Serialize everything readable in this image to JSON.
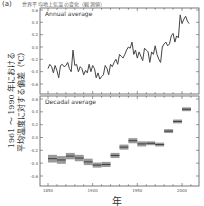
{
  "figure": {
    "panel_label": "(a)",
    "title_text": "世界平均地上気温の変化（観測値）",
    "ylabel_line1": "1961 ～ 1990 年における",
    "ylabel_line2": "平均温度に対する偏差（℃）",
    "xlabel": "年"
  },
  "chart_data": [
    {
      "type": "line",
      "title": "Annual average",
      "xlabel": "年",
      "ylabel": "1961～1990年における平均温度に対する偏差（℃）",
      "xlim": [
        1845,
        2015
      ],
      "ylim": [
        -0.65,
        0.62
      ],
      "yticks": [
        -0.6,
        -0.4,
        -0.2,
        0.0,
        0.2,
        0.4,
        0.6
      ],
      "ytick_labels": [
        "-0.6",
        "-0.4",
        "-0.2",
        "0.0",
        "0.2",
        "0.4",
        "0.6"
      ],
      "grid": false,
      "x": [
        1850,
        1852,
        1854,
        1856,
        1858,
        1860,
        1862,
        1864,
        1866,
        1868,
        1870,
        1872,
        1874,
        1876,
        1878,
        1880,
        1882,
        1884,
        1886,
        1888,
        1890,
        1892,
        1894,
        1896,
        1898,
        1900,
        1902,
        1904,
        1906,
        1908,
        1910,
        1912,
        1914,
        1916,
        1918,
        1920,
        1922,
        1924,
        1926,
        1928,
        1930,
        1932,
        1934,
        1936,
        1938,
        1940,
        1942,
        1944,
        1946,
        1948,
        1950,
        1952,
        1954,
        1956,
        1958,
        1960,
        1962,
        1964,
        1966,
        1968,
        1970,
        1972,
        1974,
        1976,
        1978,
        1980,
        1982,
        1984,
        1986,
        1988,
        1990,
        1992,
        1994,
        1996,
        1998,
        2000,
        2002,
        2004,
        2006,
        2008
      ],
      "values": [
        -0.35,
        -0.28,
        -0.32,
        -0.42,
        -0.3,
        -0.38,
        -0.5,
        -0.3,
        -0.28,
        -0.32,
        -0.3,
        -0.25,
        -0.35,
        -0.4,
        -0.05,
        -0.3,
        -0.28,
        -0.4,
        -0.32,
        -0.35,
        -0.45,
        -0.38,
        -0.42,
        -0.28,
        -0.4,
        -0.3,
        -0.35,
        -0.5,
        -0.42,
        -0.52,
        -0.48,
        -0.45,
        -0.3,
        -0.35,
        -0.45,
        -0.28,
        -0.32,
        -0.25,
        -0.2,
        -0.28,
        -0.12,
        -0.15,
        -0.18,
        -0.12,
        -0.05,
        0.0,
        -0.02,
        0.08,
        -0.12,
        -0.05,
        -0.18,
        -0.08,
        -0.15,
        -0.22,
        -0.02,
        -0.05,
        -0.08,
        -0.25,
        -0.08,
        -0.12,
        0.02,
        -0.12,
        -0.2,
        -0.25,
        0.0,
        0.05,
        0.08,
        0.02,
        0.05,
        0.18,
        0.22,
        0.08,
        0.18,
        0.15,
        0.52,
        0.38,
        0.45,
        0.5,
        0.42,
        0.38
      ],
      "series_name": "Annual average"
    },
    {
      "type": "bar",
      "title": "Decadal average",
      "xlabel": "年",
      "xlim": [
        1845,
        2015
      ],
      "ylim": [
        -0.65,
        0.62
      ],
      "yticks": [
        -0.6,
        -0.4,
        -0.2,
        0.0,
        0.2,
        0.4,
        0.6
      ],
      "ytick_labels": [
        "-0.6",
        "-0.4",
        "-0.2",
        "0.0",
        "0.2",
        "0.4",
        "0.6"
      ],
      "xticks": [
        1850,
        1900,
        1950,
        2000
      ],
      "xtick_labels": [
        "1850",
        "1900",
        "1950",
        "2000"
      ],
      "grid": false,
      "categories": [
        "1850s",
        "1860s",
        "1870s",
        "1880s",
        "1890s",
        "1900s",
        "1910s",
        "1920s",
        "1930s",
        "1940s",
        "1950s",
        "1960s",
        "1970s",
        "1980s",
        "1990s",
        "2000s"
      ],
      "decade_start": [
        1850,
        1860,
        1870,
        1880,
        1890,
        1900,
        1910,
        1920,
        1930,
        1940,
        1950,
        1960,
        1970,
        1980,
        1990,
        2000
      ],
      "values": [
        -0.33,
        -0.35,
        -0.29,
        -0.32,
        -0.38,
        -0.43,
        -0.42,
        -0.28,
        -0.15,
        -0.05,
        -0.1,
        -0.09,
        -0.11,
        0.1,
        0.25,
        0.44
      ],
      "uncertainty": [
        0.06,
        0.06,
        0.05,
        0.05,
        0.05,
        0.04,
        0.04,
        0.04,
        0.04,
        0.04,
        0.04,
        0.03,
        0.03,
        0.03,
        0.03,
        0.03
      ],
      "series_name": "Decadal average"
    }
  ]
}
